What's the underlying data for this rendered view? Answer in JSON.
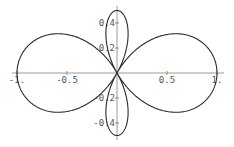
{
  "chart_data": {
    "type": "line",
    "subtype": "polar",
    "title": "",
    "xlabel": "",
    "ylabel": "",
    "function": "r(theta) = (3*cos(theta)^2 - 1)/2",
    "theta_range": [
      0,
      6.283185307
    ],
    "xlim": [
      -1.05,
      1.05
    ],
    "ylim": [
      -0.5,
      0.5
    ],
    "grid": false,
    "legend": null,
    "x_ticks": [
      {
        "value": -1,
        "label": "-1."
      },
      {
        "value": -0.5,
        "label": "-0.5"
      },
      {
        "value": 0.5,
        "label": "0.5"
      },
      {
        "value": 1,
        "label": "1."
      }
    ],
    "y_ticks": [
      {
        "value": 0.4,
        "label": "0.4"
      },
      {
        "value": 0.2,
        "label": "0.2"
      },
      {
        "value": -0.2,
        "label": "-0.2"
      },
      {
        "value": -0.4,
        "label": "-0.4"
      }
    ],
    "notable_points": [
      {
        "x": 1,
        "y": 0
      },
      {
        "x": -1,
        "y": 0
      },
      {
        "x": 0,
        "y": 0.5
      },
      {
        "x": 0,
        "y": -0.5
      },
      {
        "x": 0,
        "y": 0
      }
    ],
    "colors": {
      "curve": "#2a2a2a",
      "axes": "#9a9a9a",
      "labels": "#555555"
    }
  },
  "layout": {
    "origin_px": [
      117,
      73
    ],
    "x_scale_px": 100,
    "y_scale_px": 125,
    "x_axis_px": [
      12,
      224
    ],
    "y_axis_px": [
      6,
      140
    ]
  }
}
